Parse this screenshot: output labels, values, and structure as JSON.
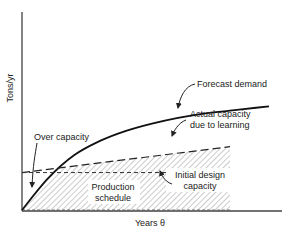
{
  "chart_data": {
    "type": "line",
    "title": "",
    "xlabel": "Years θ",
    "ylabel": "Tons/yr",
    "grid": false,
    "xlim": [
      0,
      1
    ],
    "ylim": [
      0,
      1
    ],
    "series": [
      {
        "name": "Forecast demand",
        "style": "solid",
        "x": [
          0,
          0.1,
          0.2,
          0.3,
          0.4,
          0.5,
          0.6,
          0.7,
          0.8,
          0.9,
          0.95
        ],
        "y": [
          0,
          0.22,
          0.38,
          0.48,
          0.55,
          0.6,
          0.64,
          0.67,
          0.69,
          0.71,
          0.72
        ]
      },
      {
        "name": "Actual capacity due to learning",
        "style": "long-dash",
        "x": [
          0,
          0.8
        ],
        "y": [
          0.26,
          0.44
        ]
      },
      {
        "name": "Initial design capacity",
        "style": "short-dash",
        "x": [
          0,
          0.8
        ],
        "y": [
          0.26,
          0.26
        ]
      }
    ],
    "regions": [
      {
        "name": "Production schedule",
        "fill": "hatched",
        "x_end": 0.8
      }
    ],
    "annotations": [
      {
        "text": "Forecast demand"
      },
      {
        "text": "Actual capacity due to learning",
        "lines": [
          "Actual capacity",
          "due to learning"
        ]
      },
      {
        "text": "Over capacity"
      },
      {
        "text": "Initial design capacity",
        "lines": [
          "Initial design",
          "capacity"
        ]
      },
      {
        "text": "Production schedule",
        "lines": [
          "Production",
          "schedule"
        ]
      }
    ]
  },
  "labels": {
    "ylabel": "Tons/yr",
    "xlabel": "Years θ",
    "forecast": "Forecast demand",
    "actual_1": "Actual capacity",
    "actual_2": "due to learning",
    "over": "Over capacity",
    "initial_1": "Initial design",
    "initial_2": "capacity",
    "prod_1": "Production",
    "prod_2": "schedule"
  },
  "colors": {
    "ink": "#222222",
    "hatch": "#9a9a9a"
  }
}
